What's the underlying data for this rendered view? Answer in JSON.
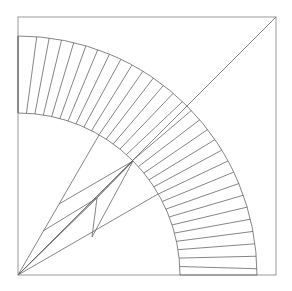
{
  "diagram": {
    "title": "",
    "type": "geometric-construction",
    "frame": {
      "x1": 18,
      "y1": 17,
      "x2": 276,
      "y2": 275
    },
    "origin": {
      "x": 18,
      "y": 275
    },
    "inner_radius": 162,
    "outer_radius": 239,
    "ring_segments": 30,
    "ring_twist_deg": 1.5,
    "diagonal": {
      "from": [
        18,
        275
      ],
      "to": [
        276,
        17
      ]
    },
    "inner_lines": [
      [
        [
          18,
          275
        ],
        [
          99,
          135
        ]
      ],
      [
        [
          18,
          275
        ],
        [
          158,
          194
        ]
      ],
      [
        [
          18,
          275
        ],
        [
          133,
          161
        ]
      ],
      [
        [
          18,
          275
        ],
        [
          97,
          198
        ]
      ],
      [
        [
          59,
          204
        ],
        [
          133,
          161
        ]
      ],
      [
        [
          43,
          231
        ],
        [
          97,
          198
        ]
      ],
      [
        [
          97,
          198
        ],
        [
          133,
          161
        ]
      ],
      [
        [
          92,
          237
        ],
        [
          133,
          161
        ]
      ],
      [
        [
          92,
          237
        ],
        [
          97,
          198
        ]
      ]
    ],
    "colors": {
      "stroke": "#666666",
      "frame": "#999999",
      "background": "#ffffff"
    }
  }
}
